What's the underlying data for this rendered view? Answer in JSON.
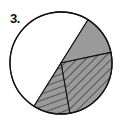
{
  "problem": {
    "number_label": "3."
  },
  "colors": {
    "shade": "#9a9a9a",
    "line": "#111111",
    "background": "#ffffff"
  },
  "chart_data": {
    "type": "pie",
    "title": "",
    "slices": [
      {
        "name": "unshaded",
        "fill": "white",
        "start_deg": 122,
        "end_deg": 302,
        "fraction": 0.5
      },
      {
        "name": "gray",
        "fill": "solid-gray",
        "start_deg": 302,
        "end_deg": 348,
        "fraction": 0.125
      },
      {
        "name": "hatch-right",
        "fill": "gray-diagonal-hatch",
        "start_deg": 348,
        "end_deg": 440,
        "fraction": 0.25
      },
      {
        "name": "hatch-lower",
        "fill": "gray-horizontal-hatch",
        "start_deg": 80,
        "end_deg": 122,
        "fraction": 0.125
      }
    ],
    "center": [
      61,
      63
    ],
    "radius": 51,
    "legend": null
  }
}
